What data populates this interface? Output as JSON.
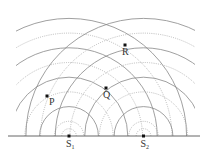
{
  "diagram": {
    "sources": [
      {
        "id": "S1",
        "label": "S",
        "subscript": "1",
        "x": 69,
        "y": 136
      },
      {
        "id": "S2",
        "label": "S",
        "subscript": "2",
        "x": 143.5,
        "y": 136
      }
    ],
    "points": [
      {
        "id": "P",
        "label": "P",
        "x": 47,
        "y": 96
      },
      {
        "id": "Q",
        "label": "Q",
        "x": 106,
        "y": 88
      },
      {
        "id": "R",
        "label": "R",
        "x": 125,
        "y": 45
      }
    ],
    "wavefronts": {
      "half_wavelength_px": 14.7,
      "solid_radii": [
        29.4,
        58.8,
        88.2,
        117.6
      ],
      "dotted_radii": [
        7.3,
        14.7,
        44.1,
        73.5,
        102.9
      ],
      "legend": {
        "solid": "crest",
        "dotted": "trough"
      }
    },
    "baseline": {
      "x1": 8,
      "x2": 200,
      "y": 136
    },
    "clip": {
      "x1": 16,
      "x2": 195
    },
    "colors": {
      "solid": "#888888",
      "dotted": "#aaaaaa",
      "baseline": "#666666",
      "point": "#111111"
    }
  }
}
